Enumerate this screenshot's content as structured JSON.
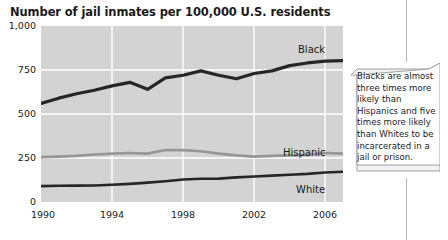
{
  "chart_data": {
    "type": "line",
    "title": "Number of jail inmates per 100,000 U.S. residents",
    "xlabel": "",
    "ylabel": "",
    "ylim": [
      0,
      1000
    ],
    "xlim": [
      1990,
      2007
    ],
    "grid": true,
    "legend_position": "inline-right",
    "yticks": [
      "0",
      "250",
      "500",
      "750",
      "1,000"
    ],
    "ytick_values": [
      0,
      250,
      500,
      750,
      1000
    ],
    "xticks": [
      "1990",
      "1994",
      "1998",
      "2002",
      "2006"
    ],
    "xtick_values": [
      1990,
      1994,
      1998,
      2002,
      2006
    ],
    "x": [
      1990,
      1991,
      1992,
      1993,
      1994,
      1995,
      1996,
      1997,
      1998,
      1999,
      2000,
      2001,
      2002,
      2003,
      2004,
      2005,
      2006,
      2007
    ],
    "series": [
      {
        "name": "Black",
        "color": "#262626",
        "values": [
          560,
          590,
          615,
          635,
          660,
          680,
          640,
          705,
          720,
          745,
          720,
          700,
          730,
          745,
          775,
          790,
          800,
          803
        ]
      },
      {
        "name": "Hispanic",
        "color": "#969696",
        "values": [
          255,
          258,
          262,
          270,
          275,
          278,
          275,
          295,
          295,
          288,
          275,
          265,
          258,
          262,
          265,
          268,
          278,
          275
        ]
      },
      {
        "name": "White",
        "color": "#262626",
        "values": [
          90,
          92,
          93,
          94,
          98,
          103,
          110,
          118,
          128,
          132,
          133,
          140,
          145,
          150,
          155,
          160,
          168,
          172
        ]
      }
    ],
    "annotation": {
      "text": "Blacks are almost three times more likely than Hispanics and five times more likely than Whites to be incarcerated in a jail or prison."
    }
  }
}
